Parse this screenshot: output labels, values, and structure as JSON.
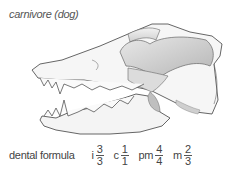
{
  "title": "carnivore (dog)",
  "formula": {
    "label": "dental formula",
    "terms": [
      {
        "letter": "i",
        "upper": "3",
        "lower": "3"
      },
      {
        "letter": "c",
        "upper": "1",
        "lower": "1"
      },
      {
        "letter": "pm",
        "upper": "4",
        "lower": "4"
      },
      {
        "letter": "m",
        "upper": "2",
        "lower": "3"
      }
    ]
  },
  "illustration": {
    "subject": "dog skull, lateral view"
  }
}
